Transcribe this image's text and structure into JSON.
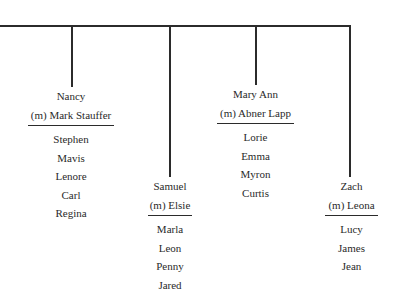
{
  "tree": {
    "trunk": {
      "x1": 0,
      "x2": 349,
      "y": 25
    },
    "families": [
      {
        "id": "nancy",
        "drop_x": 71,
        "drop_bottom": 87,
        "box": {
          "left": 28,
          "top": 87,
          "width": 86
        },
        "name": "Nancy",
        "spouse": "(m) Mark Stauffer",
        "children": [
          "Stephen",
          "Mavis",
          "Lenore",
          "Carl",
          "Regina"
        ]
      },
      {
        "id": "samuel",
        "drop_x": 169,
        "drop_bottom": 177,
        "box": {
          "left": 148,
          "top": 177,
          "width": 44
        },
        "name": "Samuel",
        "spouse": "(m) Elsie",
        "children": [
          "Marla",
          "Leon",
          "Penny",
          "Jared"
        ]
      },
      {
        "id": "mary-ann",
        "drop_x": 255,
        "drop_bottom": 85,
        "box": {
          "left": 217,
          "top": 85,
          "width": 77
        },
        "name": "Mary Ann",
        "spouse": "(m) Abner Lapp",
        "children": [
          "Lorie",
          "Emma",
          "Myron",
          "Curtis"
        ]
      },
      {
        "id": "zach",
        "drop_x": 349,
        "drop_bottom": 177,
        "box": {
          "left": 325,
          "top": 177,
          "width": 53
        },
        "name": "Zach",
        "spouse": "(m) Leona",
        "children": [
          "Lucy",
          "James",
          "Jean"
        ]
      }
    ]
  }
}
